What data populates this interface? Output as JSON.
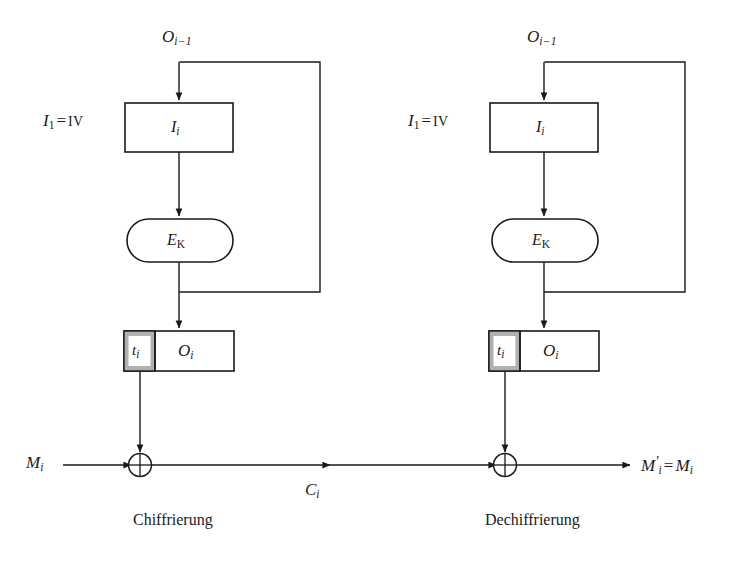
{
  "diagram": {
    "background_color": "#ffffff",
    "line_color": "#1a1a1a",
    "shade_color": "#b0b0b0",
    "panels": [
      {
        "id": "encryption",
        "caption": "Chiffrierung",
        "feedback_label": "O",
        "feedback_sub": "i−1",
        "iv_label": "I",
        "iv_sub": "1",
        "iv_eq": "=",
        "iv_value": "IV",
        "input_box_label": "I",
        "input_box_sub": "i",
        "cipher_label": "E",
        "cipher_sub": "K",
        "tag_label": "t",
        "tag_sub": "i",
        "output_label": "O",
        "output_sub": "i",
        "data_in_label": "M",
        "data_in_sub": "i",
        "data_out_label": "C",
        "data_out_sub": "i"
      },
      {
        "id": "decryption",
        "caption": "Dechiffrierung",
        "feedback_label": "O",
        "feedback_sub": "i−1",
        "iv_label": "I",
        "iv_sub": "1",
        "iv_eq": "=",
        "iv_value": "IV",
        "input_box_label": "I",
        "input_box_sub": "i",
        "cipher_label": "E",
        "cipher_sub": "K",
        "tag_label": "t",
        "tag_sub": "i",
        "output_label": "O",
        "output_sub": "i",
        "data_in_label": "",
        "data_in_sub": "",
        "data_out_label": "M",
        "data_out_sub": "i",
        "data_out_prime": "′",
        "data_out_eq": "=",
        "data_out_label2": "M",
        "data_out_sub2": "i"
      }
    ],
    "xor_symbol": "⊕"
  }
}
